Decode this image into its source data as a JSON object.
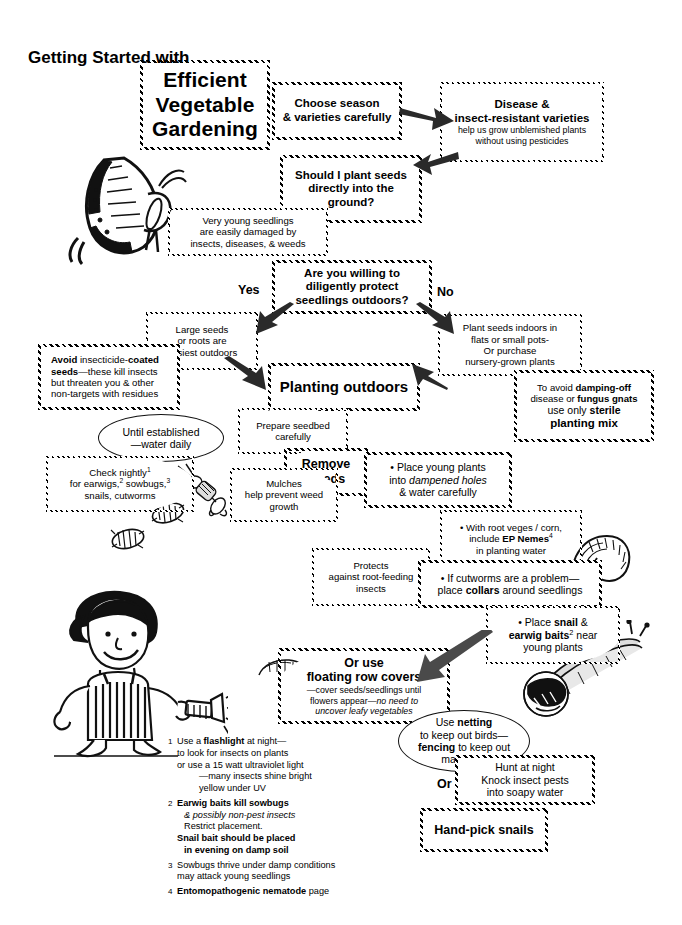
{
  "page": {
    "width": 682,
    "height": 925,
    "background": "#ffffff",
    "ink": "#000000"
  },
  "header": {
    "kicker": "Getting Started with",
    "title_line1": "Efficient",
    "title_line2": "Vegetable",
    "title_line3": "Gardening"
  },
  "illustrations": [
    {
      "name": "butterfly-illustration",
      "caption": "swallowtail butterfly"
    },
    {
      "name": "earwig-illustration",
      "caption": "earwig"
    },
    {
      "name": "sowbug-illustration-1",
      "caption": "sowbug"
    },
    {
      "name": "sowbug-illustration-2",
      "caption": "sowbug"
    },
    {
      "name": "cutworm-illustration",
      "caption": "cutworm / caterpillar"
    },
    {
      "name": "small-cutworm-illustration",
      "caption": "small cutworm"
    },
    {
      "name": "snail-illustration",
      "caption": "snail"
    },
    {
      "name": "gardener-illustration",
      "caption": "child holding a flashlight"
    }
  ],
  "labels": {
    "yes": "Yes",
    "no": "No",
    "or": "Or"
  },
  "nodes": [
    {
      "id": "choose-season",
      "shape": "oval",
      "lines": [
        "Choose season",
        "& varieties carefully"
      ]
    },
    {
      "id": "resistant-varieties",
      "shape": "oval",
      "head": [
        "Disease &",
        "insect-resistant varieties"
      ],
      "lines": [
        "help us grow unblemished plants",
        "without using pesticides"
      ]
    },
    {
      "id": "plant-seeds-question",
      "shape": "oval",
      "lines": [
        "Should I plant seeds",
        "directly into the",
        "ground?"
      ]
    },
    {
      "id": "young-seedlings",
      "shape": "rect",
      "lines": [
        "Very young seedlings",
        "are easily damaged by",
        "insects, diseases, & weeds"
      ]
    },
    {
      "id": "willing-question",
      "shape": "rect",
      "lines": [
        "Are you willing to",
        "diligently protect",
        "seedlings outdoors?"
      ]
    },
    {
      "id": "large-seeds",
      "shape": "oval",
      "lines": [
        "Large seeds",
        "or roots are",
        "easiest outdoors"
      ]
    },
    {
      "id": "plant-indoors",
      "shape": "rect",
      "lines": [
        "Plant seeds indoors in",
        "flats or small pots-",
        "Or purchase",
        "nursery-grown plants"
      ]
    },
    {
      "id": "avoid-coated-seeds",
      "shape": "rect",
      "lines": [
        "Avoid insecticide-coated",
        "seeds—these kill insects",
        "but threaten you & other",
        "non-targets with residues"
      ]
    },
    {
      "id": "planting-outdoors",
      "shape": "oval",
      "lines": [
        "Planting outdoors"
      ]
    },
    {
      "id": "sterile-mix",
      "shape": "rect",
      "lines": [
        "To avoid damping-off",
        "disease or fungus gnats",
        "use only sterile",
        "planting mix"
      ]
    },
    {
      "id": "prepare-seedbed",
      "shape": "oval",
      "lines": [
        "Prepare seedbed",
        "carefully"
      ]
    },
    {
      "id": "until-established",
      "shape": "oval",
      "lines": [
        "Until established",
        "—water daily"
      ]
    },
    {
      "id": "remove-weeds",
      "shape": "oval",
      "lines": [
        "Remove",
        "weeds"
      ]
    },
    {
      "id": "check-nightly",
      "shape": "oval",
      "lines": [
        "Check nightly¹",
        "for earwigs, ² sowbugs,³",
        "snails, cutworms"
      ]
    },
    {
      "id": "mulches",
      "shape": "oval",
      "lines": [
        "Mulches",
        "help prevent weed",
        "growth"
      ]
    },
    {
      "id": "place-young-plants",
      "shape": "rect",
      "lines": [
        "• Place young plants",
        "into dampened holes",
        "& water carefully"
      ]
    },
    {
      "id": "ep-nemes",
      "shape": "oval",
      "lines": [
        "• With root veges / corn,",
        "include EP Nemes⁴",
        "in planting water"
      ]
    },
    {
      "id": "protects-roots",
      "shape": "oval",
      "lines": [
        "Protects",
        "against root-feeding",
        "insects"
      ]
    },
    {
      "id": "cutworm-collars",
      "shape": "rect",
      "lines": [
        "• If cutworms are a problem—",
        "place collars around seedlings"
      ]
    },
    {
      "id": "snail-earwig-baits",
      "shape": "oval",
      "lines": [
        "• Place snail  &",
        "earwig baits² near",
        "young plants"
      ]
    },
    {
      "id": "floating-row-covers",
      "shape": "oval",
      "head": [
        "Or use",
        "floating row covers"
      ],
      "lines": [
        "—cover seeds/seedlings until",
        "flowers appear—no need to",
        "uncover leafy vegetables"
      ]
    },
    {
      "id": "netting-fencing",
      "shape": "oval",
      "lines": [
        "Use netting",
        "to keep out  birds—",
        "fencing to keep out",
        "mammals"
      ]
    },
    {
      "id": "hunt-at-night",
      "shape": "rect",
      "lines": [
        "Hunt at night",
        "Knock insect pests",
        "into soapy water"
      ]
    },
    {
      "id": "hand-pick-snails",
      "shape": "rect",
      "lines": [
        "Hand-pick snails"
      ]
    }
  ],
  "node_text": {
    "choose_season_l1": "Choose season",
    "choose_season_l2": "& varieties carefully",
    "resistant_h1": "Disease &",
    "resistant_h2": "insect-resistant varieties",
    "resistant_l1": "help us grow unblemished plants",
    "resistant_l2": "without using pesticides",
    "plant_q_l1": "Should I plant seeds",
    "plant_q_l2": "directly into the",
    "plant_q_l3": "ground?",
    "young_l1": "Very young seedlings",
    "young_l2": "are easily damaged by",
    "young_l3": "insects, diseases, & weeds",
    "willing_l1": "Are you willing to",
    "willing_l2": "diligently protect",
    "willing_l3": "seedlings outdoors?",
    "large_l1": "Large seeds",
    "large_l2": "or roots are",
    "large_l3": "easiest outdoors",
    "indoors_l1": "Plant seeds indoors in",
    "indoors_l2": "flats or small pots-",
    "indoors_l3": "Or purchase",
    "indoors_l4": "nursery-grown plants",
    "avoid_l1a": "Avoid",
    "avoid_l1b": " insecticide-",
    "avoid_l1c": "coated",
    "avoid_l2a": "seeds",
    "avoid_l2b": "—these kill insects",
    "avoid_l3": "but threaten you & other",
    "avoid_l4": "non-targets with residues",
    "planting_outdoors": "Planting outdoors",
    "sterile_l1a": "To avoid ",
    "sterile_l1b": "damping-off",
    "sterile_l2a": "disease or ",
    "sterile_l2b": "fungus gnats",
    "sterile_l3a": "use only ",
    "sterile_l3b": "sterile",
    "sterile_l4": "planting mix",
    "prepare_l1": "Prepare seedbed",
    "prepare_l2": "carefully",
    "until_l1": "Until established",
    "until_l2": "—water daily",
    "remove_l1": "Remove",
    "remove_l2": "weeds",
    "check_l1": "Check nightly",
    "check_l1sup": "1",
    "check_l2a": "for earwigs,",
    "check_l2sup1": "2",
    "check_l2b": " sowbugs,",
    "check_l2sup2": "3",
    "check_l3": "snails, cutworms",
    "mulches_l1": "Mulches",
    "mulches_l2": "help prevent weed",
    "mulches_l3": "growth",
    "young_plants_l1": "• Place young plants",
    "young_plants_l2a": "into ",
    "young_plants_l2b": "dampened holes",
    "young_plants_l3": "& water carefully",
    "nemes_l1": "• With root veges / corn,",
    "nemes_l2a": "include ",
    "nemes_l2b": "EP Nemes",
    "nemes_l2sup": "4",
    "nemes_l3": "in planting water",
    "protects_l1": "Protects",
    "protects_l2": "against root-feeding",
    "protects_l3": "insects",
    "collars_l1": "• If cutworms are a problem—",
    "collars_l2a": "place ",
    "collars_l2b": "collars",
    "collars_l2c": " around seedlings",
    "baits_l1a": "• Place ",
    "baits_l1b": "snail",
    "baits_l1c": "  &",
    "baits_l2a": "earwig baits",
    "baits_l2sup": "2",
    "baits_l2b": " near",
    "baits_l3": "young plants",
    "rowcover_h1": "Or use",
    "rowcover_h2": "floating row covers",
    "rowcover_l1": "—cover seeds/seedlings until",
    "rowcover_l2a": "flowers appear—",
    "rowcover_l2b": "no need to",
    "rowcover_l3": "uncover leafy vegetables",
    "netting_l1a": "Use ",
    "netting_l1b": "netting",
    "netting_l2": "to keep out  birds—",
    "netting_l3a": "fencing",
    "netting_l3b": " to keep out",
    "netting_l4": "mammals",
    "hunt_l1": "Hunt at night",
    "hunt_l2": "Knock insect pests",
    "hunt_l3": "into soapy water",
    "handpick": "Hand-pick snails"
  },
  "footnotes": [
    {
      "num": "1",
      "lines": [
        "Use a flashlight at night—",
        "to look for insects on plants",
        "or use a 15 watt ultraviolet light",
        "—many insects shine bright",
        "yellow under UV"
      ]
    },
    {
      "num": "2",
      "lines": [
        "Earwig baits  kill sowbugs",
        "& possibly non-pest insects",
        "Restrict placement.",
        "Snail bait should be placed",
        "in evening on damp soil"
      ]
    },
    {
      "num": "3",
      "lines": [
        "Sowbugs thrive under damp conditions",
        "may attack young seedlings"
      ]
    },
    {
      "num": "4",
      "lines": [
        "Entomopathogenic nematode page"
      ]
    }
  ],
  "footnote_text": {
    "f1_l1a": "Use a ",
    "f1_l1b": "flashlight",
    "f1_l1c": " at night—",
    "f1_l2": "to look for insects on plants",
    "f1_l3": "or use a 15 watt ultraviolet light",
    "f1_l4": "—many insects shine bright",
    "f1_l5": "yellow under UV",
    "f2_l1a": "Earwig baits",
    "f2_l1b": "  kill sowbugs",
    "f2_l2": "& possibly non-pest insects",
    "f2_l3": "Restrict placement.",
    "f2_l4": "Snail bait should be placed",
    "f2_l5": "in evening on damp soil",
    "f3_l1": "Sowbugs thrive under damp conditions",
    "f3_l2": "may attack young seedlings",
    "f4_l1a": "Entomopathogenic nematode",
    "f4_l1b": " page",
    "n1": "1",
    "n2": "2",
    "n3": "3",
    "n4": "4"
  }
}
